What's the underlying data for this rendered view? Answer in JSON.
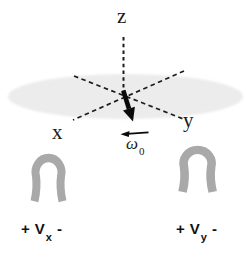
{
  "figure": {
    "background": "#ffffff",
    "colors": {
      "ellipse_fill": "#ececec",
      "coil_gray": "#a9a9a9",
      "line": "#1c1c1c",
      "arrow_black": "#0a0a0a"
    },
    "labels": {
      "z_axis": "z",
      "x_axis": "x",
      "y_axis": "y",
      "omega": {
        "base": "ω",
        "sub": "0"
      },
      "v_x": {
        "plus": "+",
        "base": "V",
        "sub": "x",
        "minus": "-"
      },
      "v_y": {
        "plus": "+",
        "base": "V",
        "sub": "y",
        "minus": "-"
      }
    }
  }
}
